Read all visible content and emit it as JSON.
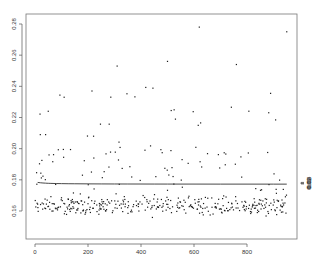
{
  "chart_data": {
    "type": "scatter",
    "title": "",
    "xlabel": "",
    "ylabel": "",
    "y2label": "",
    "grid": false,
    "legend": null,
    "xlim": [
      -30,
      990
    ],
    "ylim": [
      0.147,
      0.288
    ],
    "y2lim": [
      0.0057,
      0.0425
    ],
    "x_ticks": [
      0,
      200,
      400,
      600,
      800
    ],
    "x_tick_labels": [
      "0",
      "200",
      "400",
      "600",
      "800"
    ],
    "y_ticks": [
      0.16,
      0.18,
      0.2,
      0.22,
      0.24,
      0.26,
      0.28
    ],
    "y_tick_labels": [
      "0.16",
      "0.18",
      "0.20",
      "0.22",
      "0.24",
      "0.26",
      "0.28"
    ],
    "y2_ticks": [
      0.01,
      0.02,
      0.03,
      0.04
    ],
    "y2_tick_labels": [
      "0.01",
      "0.02",
      "0.03",
      "0.04"
    ],
    "series": [
      {
        "name": "points",
        "kind": "scatter",
        "axis": "left",
        "n_points": 950,
        "x_range": [
          1,
          950
        ],
        "y_bulk_range": [
          0.155,
          0.175
        ],
        "y_bulk_center": 0.163,
        "y_outlier_max": 0.278,
        "notable_outliers": [
          {
            "x": 620,
            "y": 0.278
          },
          {
            "x": 950,
            "y": 0.275
          },
          {
            "x": 310,
            "y": 0.253
          },
          {
            "x": 500,
            "y": 0.256
          },
          {
            "x": 760,
            "y": 0.254
          },
          {
            "x": 110,
            "y": 0.233
          },
          {
            "x": 215,
            "y": 0.237
          },
          {
            "x": 50,
            "y": 0.224
          },
          {
            "x": 20,
            "y": 0.209
          },
          {
            "x": 40,
            "y": 0.209
          }
        ]
      },
      {
        "name": "curve",
        "kind": "line",
        "axis": "right",
        "x": [
          10,
          20,
          30,
          40,
          50,
          60,
          80,
          100,
          125,
          150,
          200,
          250,
          300,
          350,
          400,
          450,
          500,
          600,
          700,
          800,
          900,
          950
        ],
        "y": [
          0.04,
          0.0335,
          0.029,
          0.0258,
          0.0232,
          0.0212,
          0.0186,
          0.0168,
          0.0152,
          0.0141,
          0.0124,
          0.0113,
          0.0105,
          0.0099,
          0.0094,
          0.009,
          0.0087,
          0.0083,
          0.008,
          0.0078,
          0.0076,
          0.0075
        ]
      }
    ],
    "layout": {
      "frame": {
        "left": 26,
        "top": 14,
        "right": 297,
        "bottom": 239
      }
    }
  }
}
